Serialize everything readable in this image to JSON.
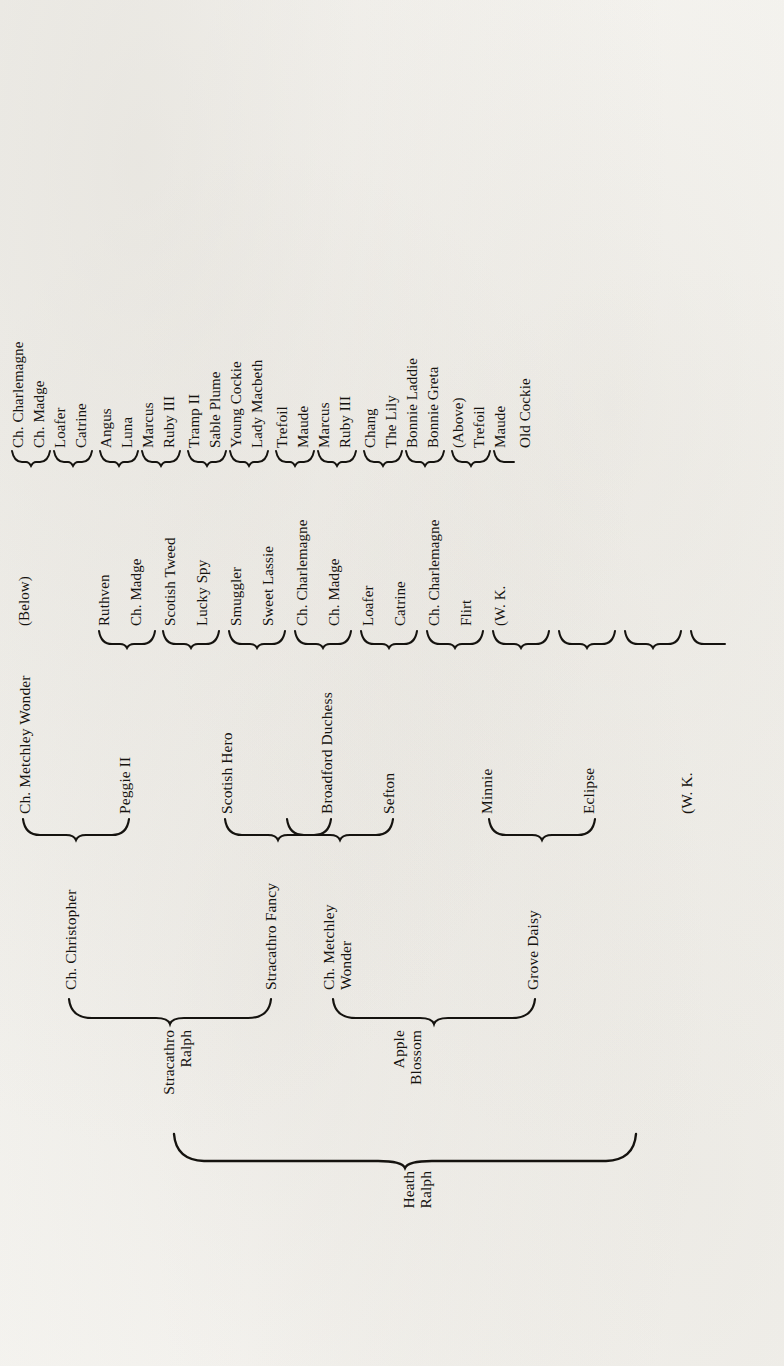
{
  "document": {
    "type": "pedigree-chart",
    "orientation": "rotated-90-ccw",
    "subject": "Heath Ralph"
  },
  "pedigree": {
    "root": {
      "label": "Heath\nRalph"
    },
    "generation_1": [
      {
        "label": "Stracathro\nRalph"
      },
      {
        "label": "Apple\nBlossom"
      }
    ],
    "generation_2": [
      {
        "label": "Ch. Christopher"
      },
      {
        "label": "Stracathro Fancy"
      },
      {
        "label": "Ch. Metchley\nWonder"
      },
      {
        "label": "Grove Daisy"
      }
    ],
    "generation_3": [
      {
        "label": "Ch. Metchley Wonder"
      },
      {
        "label": "Peggie II"
      },
      {
        "label": "Scotish Hero"
      },
      {
        "label": "Broadford Duchess"
      },
      {
        "label": "Sefton"
      },
      {
        "label": "Minnie"
      },
      {
        "label": "Eclipse"
      },
      {
        "label": "(W. K."
      }
    ],
    "generation_4": [
      {
        "label": "(Below)"
      },
      {
        "label": "Ruthven"
      },
      {
        "label": "Ch. Madge"
      },
      {
        "label": "Scotish Tweed"
      },
      {
        "label": "Lucky Spy"
      },
      {
        "label": "Smuggler"
      },
      {
        "label": "Sweet Lassie"
      },
      {
        "label": "Ch. Charlemagne"
      },
      {
        "label": "Ch. Madge"
      },
      {
        "label": "Loafer"
      },
      {
        "label": "Catrine"
      },
      {
        "label": "Ch. Charlemagne"
      },
      {
        "label": "Flirt"
      },
      {
        "label": "(W. K."
      }
    ],
    "generation_5": [
      {
        "label": "Ch. Charlemagne"
      },
      {
        "label": "Ch. Madge"
      },
      {
        "label": "Loafer"
      },
      {
        "label": "Catrine"
      },
      {
        "label": "Angus"
      },
      {
        "label": "Luna"
      },
      {
        "label": "Marcus"
      },
      {
        "label": "Ruby III"
      },
      {
        "label": "Tramp II"
      },
      {
        "label": "Sable Plume"
      },
      {
        "label": "Young Cockie"
      },
      {
        "label": "Lady Macbeth"
      },
      {
        "label": "Trefoil"
      },
      {
        "label": "Maude"
      },
      {
        "label": "Marcus"
      },
      {
        "label": "Ruby III"
      },
      {
        "label": "Chang"
      },
      {
        "label": "The Lily"
      },
      {
        "label": "Bonnie Laddie"
      },
      {
        "label": "Bonnie Greta"
      },
      {
        "label": "(Above)"
      },
      {
        "label": "Trefoil"
      },
      {
        "label": "Maude"
      },
      {
        "label": "Old Cockie"
      }
    ]
  },
  "colors": {
    "ink": "#15130f",
    "paper": "#f7f6f3"
  }
}
